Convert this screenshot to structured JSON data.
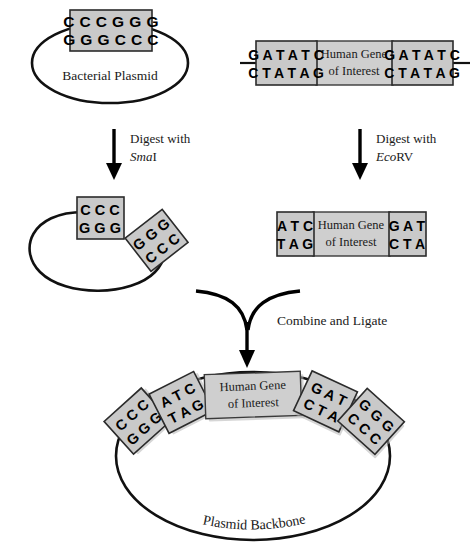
{
  "figure": {
    "colors": {
      "box_fill": "#c9c9c9",
      "gene_fill": "#cfcfcf",
      "outline": "#111111",
      "background": "#ffffff"
    }
  },
  "top_left": {
    "label": "Bacterial Plasmid",
    "site": {
      "top_strand": "C C C G G G",
      "bottom_strand": "G G G C C C"
    }
  },
  "top_right": {
    "gene_line1": "Human Gene",
    "gene_line2": "of Interest",
    "left_site": {
      "top_strand": "G A T A T C",
      "bottom_strand": "C T A T A G"
    },
    "right_site": {
      "top_strand": "G A T A T C",
      "bottom_strand": "C T A T A G"
    }
  },
  "arrows": {
    "left_digest_line1": "Digest with",
    "left_digest_enzyme_italic": "Sma",
    "left_digest_enzyme_roman": "I",
    "right_digest_line1": "Digest with",
    "right_digest_enzyme_italic": "Eco",
    "right_digest_enzyme_roman": "RV",
    "combine_label": "Combine and Ligate"
  },
  "mid_left": {
    "attached_fragment": {
      "top_strand": "C C C",
      "bottom_strand": "G G G"
    },
    "free_fragment": {
      "top_strand": "G G G",
      "bottom_strand": "C C C"
    }
  },
  "mid_right": {
    "gene_line1": "Human Gene",
    "gene_line2": "of Interest",
    "left_overhang": {
      "top_strand": "A T C",
      "bottom_strand": "T A G"
    },
    "right_overhang": {
      "top_strand": "G A T",
      "bottom_strand": "C T A"
    }
  },
  "bottom": {
    "backbone_label": "Plasmid Backbone",
    "gene_line1": "Human Gene",
    "gene_line2": "of Interest",
    "segments": [
      {
        "name": "plasmid-left-end",
        "top_strand": "C C C",
        "bottom_strand": "G G G"
      },
      {
        "name": "insert-left-junction",
        "top_strand": "A T C",
        "bottom_strand": "T A G"
      },
      {
        "name": "insert-right-junction",
        "top_strand": "G A T",
        "bottom_strand": "C T A"
      },
      {
        "name": "plasmid-right-end",
        "top_strand": "G G G",
        "bottom_strand": "C C C"
      }
    ]
  }
}
